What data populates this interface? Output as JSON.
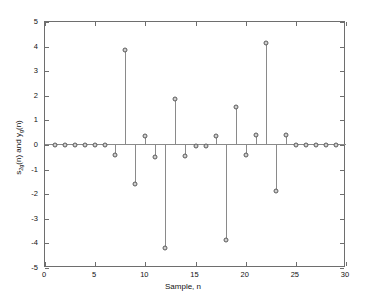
{
  "chart_data": {
    "type": "line",
    "plot_style": "stem",
    "title": "",
    "xlabel": "Sample, n",
    "ylabel": "s2g(n) and yg(n)",
    "ylabel_parts": {
      "s": "s",
      "s_sub": "2g",
      "mid": "(n) and y",
      "y_sub": "g",
      "end": "(n)"
    },
    "xlim": [
      0,
      30
    ],
    "ylim": [
      -5,
      5
    ],
    "xticks": [
      0,
      5,
      10,
      15,
      20,
      25,
      30
    ],
    "yticks": [
      5,
      4,
      3,
      2,
      1,
      0,
      -1,
      -2,
      -3,
      -4,
      -5
    ],
    "xticklabels": [
      "0",
      "5",
      "10",
      "15",
      "20",
      "25",
      "30"
    ],
    "yticklabels": [
      "5",
      "4",
      "3",
      "2",
      "1",
      "0",
      "-1",
      "-2",
      "-3",
      "-4",
      "-5"
    ],
    "grid": false,
    "legend": false,
    "marker": "circle-open",
    "x": [
      1,
      2,
      3,
      4,
      5,
      6,
      7,
      8,
      9,
      10,
      11,
      12,
      13,
      14,
      15,
      16,
      17,
      18,
      19,
      20,
      21,
      22,
      23,
      24,
      25,
      26,
      27,
      28,
      29
    ],
    "values": [
      0.0,
      0.0,
      0.0,
      0.0,
      0.0,
      0.0,
      -0.42,
      3.85,
      -1.57,
      0.38,
      -0.5,
      -4.2,
      1.85,
      -0.45,
      -0.05,
      -0.05,
      0.38,
      -3.85,
      1.55,
      -0.4,
      0.42,
      4.15,
      -1.87,
      0.4,
      0.0,
      0.0,
      0.0,
      0.0,
      0.0
    ],
    "colors": {
      "axis": "#6e6e6e",
      "stem": "#8a8a8a",
      "marker_edge": "#5a5a5a",
      "marker_face": "#cfcfcf",
      "background": "#ffffff"
    }
  }
}
